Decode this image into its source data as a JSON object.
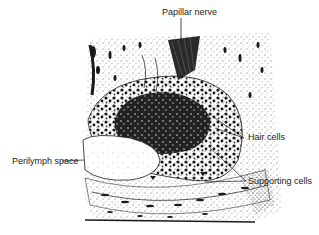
{
  "figure": {
    "labels": {
      "papillar_nerve": "Papillar nerve",
      "hair_cells": "Hair cells",
      "perilymph_space": "Perilymph space",
      "supporting_cells": "Supporting cells"
    },
    "colors": {
      "ink": "#1a1a1a",
      "paper": "#ffffff",
      "stipple": "#555555"
    }
  }
}
